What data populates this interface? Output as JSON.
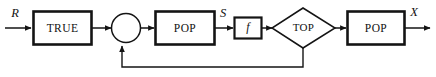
{
  "diagram": {
    "background_color": "#ffffff",
    "stroke_color": "#141414",
    "nodes": [
      {
        "id": "true-block",
        "label": "TRUE",
        "shape": "rectangle"
      },
      {
        "id": "sum-junction",
        "label": "",
        "shape": "circle"
      },
      {
        "id": "pop-block-1",
        "label": "POP",
        "shape": "rectangle"
      },
      {
        "id": "f-block",
        "label": "f",
        "shape": "rectangle"
      },
      {
        "id": "top-decision",
        "label": "TOP",
        "shape": "diamond"
      },
      {
        "id": "pop-block-2",
        "label": "POP",
        "shape": "rectangle"
      }
    ],
    "signals": [
      {
        "id": "input-signal",
        "label": "R"
      },
      {
        "id": "internal-signal",
        "label": "S"
      },
      {
        "id": "output-signal",
        "label": "X"
      }
    ],
    "connections": [
      {
        "id": "wire-input-to-true",
        "from": "input",
        "to": "true-block"
      },
      {
        "id": "wire-true-to-sum",
        "from": "true-block",
        "to": "sum-junction"
      },
      {
        "id": "wire-sum-to-pop1",
        "from": "sum-junction",
        "to": "pop-block-1"
      },
      {
        "id": "wire-pop1-to-f",
        "from": "pop-block-1",
        "to": "f-block"
      },
      {
        "id": "wire-f-to-top",
        "from": "f-block",
        "to": "top-decision"
      },
      {
        "id": "wire-top-to-pop2",
        "from": "top-decision",
        "to": "pop-block-2"
      },
      {
        "id": "wire-pop2-to-output",
        "from": "pop-block-2",
        "to": "output"
      },
      {
        "id": "wire-feedback-top-to-sum",
        "from": "top-decision",
        "to": "sum-junction"
      }
    ]
  }
}
